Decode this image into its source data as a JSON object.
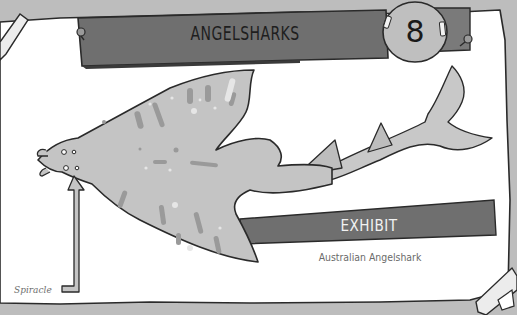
{
  "header": {
    "title": "ANGELSHARKS",
    "badge_number": "8"
  },
  "exhibit": {
    "label": "EXHIBIT",
    "species": "Australian Angelshark"
  },
  "annotations": {
    "spiracle_label": "Spiracle"
  },
  "colors": {
    "background": "#bdbdbd",
    "paper": "#ffffff",
    "banner": "#6f6f6f",
    "banner_dark": "#7a7a7a",
    "badge": "#bfbfbf",
    "shark_body": "#c4c4c4",
    "outline": "#2a2a2a",
    "tape": "#e8e8e8"
  }
}
